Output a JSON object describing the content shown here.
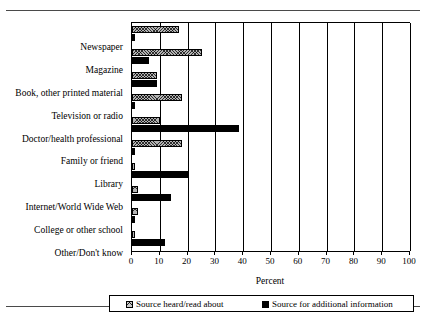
{
  "chart_data": {
    "type": "bar",
    "orientation": "horizontal",
    "title": "",
    "xlabel": "Percent",
    "ylabel": "",
    "xlim": [
      0,
      100
    ],
    "xticks": [
      0,
      10,
      20,
      30,
      40,
      50,
      60,
      70,
      80,
      90,
      100
    ],
    "grid": true,
    "grid_axis": "x",
    "legend_position": "bottom",
    "categories": [
      "Newspaper",
      "Magazine",
      "Book, other printed material",
      "Television or radio",
      "Doctor/health professional",
      "Family or friend",
      "Library",
      "Internet/World Wide Web",
      "College or other school",
      "Other/Don't know"
    ],
    "series": [
      {
        "name": "Source heard/read about",
        "values": [
          17,
          25,
          9,
          18,
          10,
          18,
          1,
          2,
          2,
          1
        ]
      },
      {
        "name": "Source for additional information",
        "values": [
          1,
          6,
          9,
          1,
          38.5,
          1,
          20,
          14,
          1,
          12
        ]
      }
    ]
  },
  "colors": {
    "series_heard_fill": "#b3b3b3",
    "series_additional_fill": "#000000",
    "axis": "#000000",
    "background": "#ffffff",
    "rule": "#4a4a4a"
  }
}
